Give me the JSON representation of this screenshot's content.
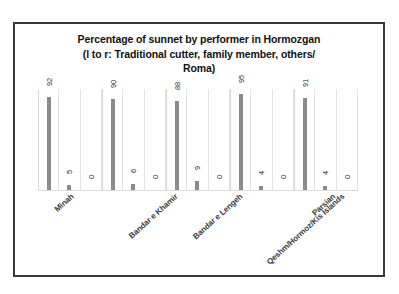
{
  "chart_data": {
    "type": "bar",
    "title": "Percentage of sunnet by performer in Hormozgan (l to r: Traditional cutter, family member, others/ Roma)",
    "title_lines": [
      "Percentage of sunnet by performer in Hormozgan",
      "(l to r: Traditional cutter, family member, others/",
      "Roma)"
    ],
    "xlabel": "",
    "ylabel": "",
    "ylim": [
      0,
      100
    ],
    "grid": true,
    "legend": null,
    "categories": [
      "Minah",
      "Bandar e Khamir",
      "Bandar e Lengeh",
      "Qeshm/Hormoz/Kis Islands",
      "Parsian"
    ],
    "series": [
      {
        "name": "Traditional cutter",
        "values": [
          92,
          90,
          88,
          95,
          91
        ]
      },
      {
        "name": "family member",
        "values": [
          5,
          6,
          9,
          4,
          4
        ]
      },
      {
        "name": "others/ Roma",
        "values": [
          0,
          0,
          0,
          0,
          0
        ]
      }
    ],
    "bar_labels": [
      [
        "92",
        "5",
        "0"
      ],
      [
        "90",
        "6",
        "0"
      ],
      [
        "88",
        "9",
        "0"
      ],
      [
        "95",
        "4",
        "0"
      ],
      [
        "91",
        "4",
        "0"
      ]
    ],
    "colors": {
      "bar": "#8b8b8b",
      "gridline": "#e2e2e2",
      "frame": "#3a3a3a",
      "label_text": "#3a3a3a",
      "value_text": "#2a2a2a"
    }
  }
}
